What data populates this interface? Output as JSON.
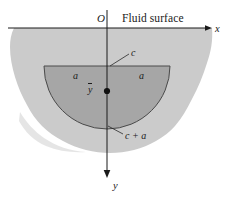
{
  "figure": {
    "title_visible": false,
    "labels": {
      "origin": "O",
      "fluid_surface": "Fluid surface",
      "x_axis": "x",
      "y_axis": "y",
      "depth_top": "c",
      "half_width_left": "a",
      "half_width_right": "a",
      "depth_bottom": "c + a",
      "centroid": "y"
    },
    "colors": {
      "background": "#ffffff",
      "fluid_fill": "#cccccc",
      "plate_fill": "#a8a8a8",
      "outline": "#3a3a3a",
      "axis": "#1a1a1a",
      "text": "#1a1a1a"
    },
    "geometry": {
      "origin_px": [
        107,
        28
      ],
      "surface_line_y_px": 28,
      "plate_center_px": [
        107,
        66
      ],
      "plate_radius_px": 63,
      "plate_top_y_px": 66,
      "plate_bottom_y_px": 129,
      "centroid_dot_px": [
        107,
        91
      ],
      "x_arrow_tip_px": [
        210,
        28
      ],
      "y_arrow_tip_px": [
        107,
        176
      ]
    }
  }
}
